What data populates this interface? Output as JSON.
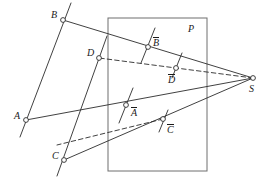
{
  "figure": {
    "type": "geometric-projection-diagram",
    "canvas": {
      "width": 262,
      "height": 187,
      "background": "#ffffff"
    },
    "stroke_color": "#2b2b2b",
    "label_color": "#1a1a1a",
    "plane": {
      "name": "P",
      "label": "P",
      "label_pos": {
        "x": 188,
        "y": 24
      },
      "rect": {
        "x": 108,
        "y": 18,
        "width": 99,
        "height": 153
      }
    },
    "center": {
      "name": "S",
      "label": "S",
      "point": {
        "x": 253,
        "y": 78
      },
      "label_pos": {
        "x": 249,
        "y": 84
      }
    },
    "points": [
      {
        "id": "B",
        "label": "B",
        "barred": false,
        "x": 63,
        "y": 20,
        "label_pos": {
          "x": 51,
          "y": 10
        }
      },
      {
        "id": "D",
        "label": "D",
        "barred": false,
        "x": 99,
        "y": 58,
        "label_pos": {
          "x": 87,
          "y": 48
        }
      },
      {
        "id": "A",
        "label": "A",
        "barred": false,
        "x": 26,
        "y": 120,
        "label_pos": {
          "x": 14,
          "y": 111
        }
      },
      {
        "id": "C",
        "label": "C",
        "barred": false,
        "x": 64,
        "y": 160,
        "label_pos": {
          "x": 52,
          "y": 151
        }
      },
      {
        "id": "Bbar",
        "label": "B",
        "barred": true,
        "x": 148,
        "y": 47,
        "label_pos": {
          "x": 153,
          "y": 38
        }
      },
      {
        "id": "Dbar",
        "label": "D",
        "barred": true,
        "x": 176,
        "y": 68,
        "label_pos": {
          "x": 168,
          "y": 75
        }
      },
      {
        "id": "Abar",
        "label": "A",
        "barred": true,
        "x": 126,
        "y": 105,
        "label_pos": {
          "x": 131,
          "y": 108
        }
      },
      {
        "id": "Cbar",
        "label": "C",
        "barred": true,
        "x": 163,
        "y": 119,
        "label_pos": {
          "x": 167,
          "y": 125
        }
      }
    ],
    "segments": [
      {
        "name": "line-AB",
        "style": "solid",
        "x1": 20,
        "y1": 137,
        "x2": 71,
        "y2": 3
      },
      {
        "name": "line-CD",
        "style": "solid",
        "x1": 57,
        "y1": 176,
        "x2": 107,
        "y2": 36
      },
      {
        "name": "ray-S-B",
        "style": "solid",
        "x1": 253,
        "y1": 78,
        "x2": 63,
        "y2": 20
      },
      {
        "name": "ray-S-A",
        "style": "solid",
        "x1": 253,
        "y1": 78,
        "x2": 26,
        "y2": 120
      },
      {
        "name": "ray-S-C",
        "style": "solid",
        "x1": 253,
        "y1": 78,
        "x2": 64,
        "y2": 160
      },
      {
        "name": "ray-S-D",
        "style": "dashed",
        "x1": 253,
        "y1": 78,
        "x2": 99,
        "y2": 58
      },
      {
        "name": "ray-S-Cbar",
        "style": "dashed",
        "x1": 163,
        "y1": 119,
        "x2": 57,
        "y2": 145
      },
      {
        "name": "tick-Bbar",
        "style": "solid",
        "x1": 141,
        "y1": 63,
        "x2": 155,
        "y2": 28
      },
      {
        "name": "tick-Dbar",
        "style": "solid",
        "x1": 172,
        "y1": 78,
        "x2": 182,
        "y2": 53
      },
      {
        "name": "tick-Abar",
        "style": "solid",
        "x1": 119,
        "y1": 123,
        "x2": 133,
        "y2": 88
      },
      {
        "name": "tick-Cbar",
        "style": "solid",
        "x1": 159,
        "y1": 132,
        "x2": 168,
        "y2": 110
      }
    ]
  }
}
